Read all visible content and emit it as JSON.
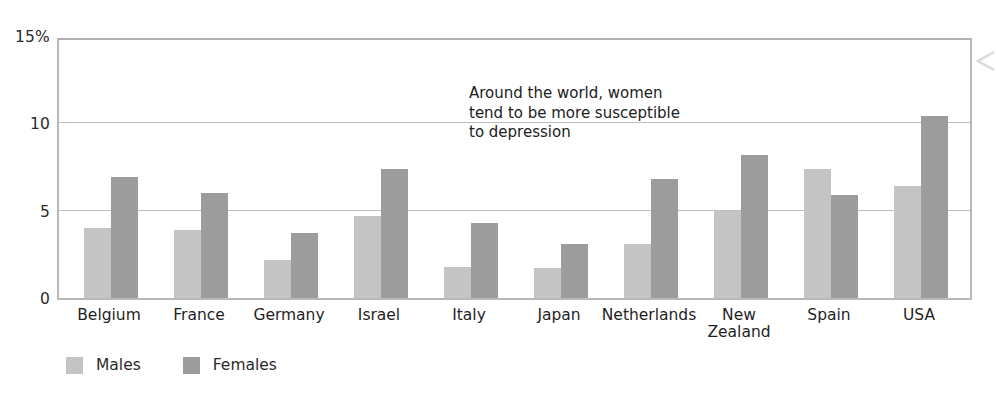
{
  "chart_data": {
    "type": "bar",
    "title": "",
    "subtitle": "",
    "xlabel": "",
    "ylabel": "",
    "ylim": [
      0,
      15
    ],
    "yticks": [
      0,
      5,
      10,
      15
    ],
    "ytick_labels": [
      "0",
      "5",
      "10",
      "15%"
    ],
    "grid": true,
    "legend_position": "bottom-left",
    "categories": [
      "Belgium",
      "France",
      "Germany",
      "Israel",
      "Italy",
      "Japan",
      "Netherlands",
      "New\nZealand",
      "Spain",
      "USA"
    ],
    "series": [
      {
        "name": "Males",
        "color": "#c4c4c4",
        "values": [
          4.0,
          3.9,
          2.2,
          4.7,
          1.8,
          1.7,
          3.1,
          5.0,
          7.4,
          6.4
        ]
      },
      {
        "name": "Females",
        "color": "#9c9c9c",
        "values": [
          6.9,
          6.0,
          3.7,
          7.4,
          4.3,
          3.1,
          6.8,
          8.2,
          5.9,
          10.4
        ]
      }
    ],
    "annotations": [
      {
        "text": "Around the world, women tend to be more susceptible to depression",
        "lines": [
          "Around the world, women",
          "tend to be more susceptible",
          "to depression"
        ]
      }
    ]
  },
  "legend": {
    "items": [
      {
        "label": "Males",
        "color": "#c4c4c4"
      },
      {
        "label": "Females",
        "color": "#9c9c9c"
      }
    ]
  },
  "icons": {
    "right_arrow": "chevron-left-icon"
  }
}
